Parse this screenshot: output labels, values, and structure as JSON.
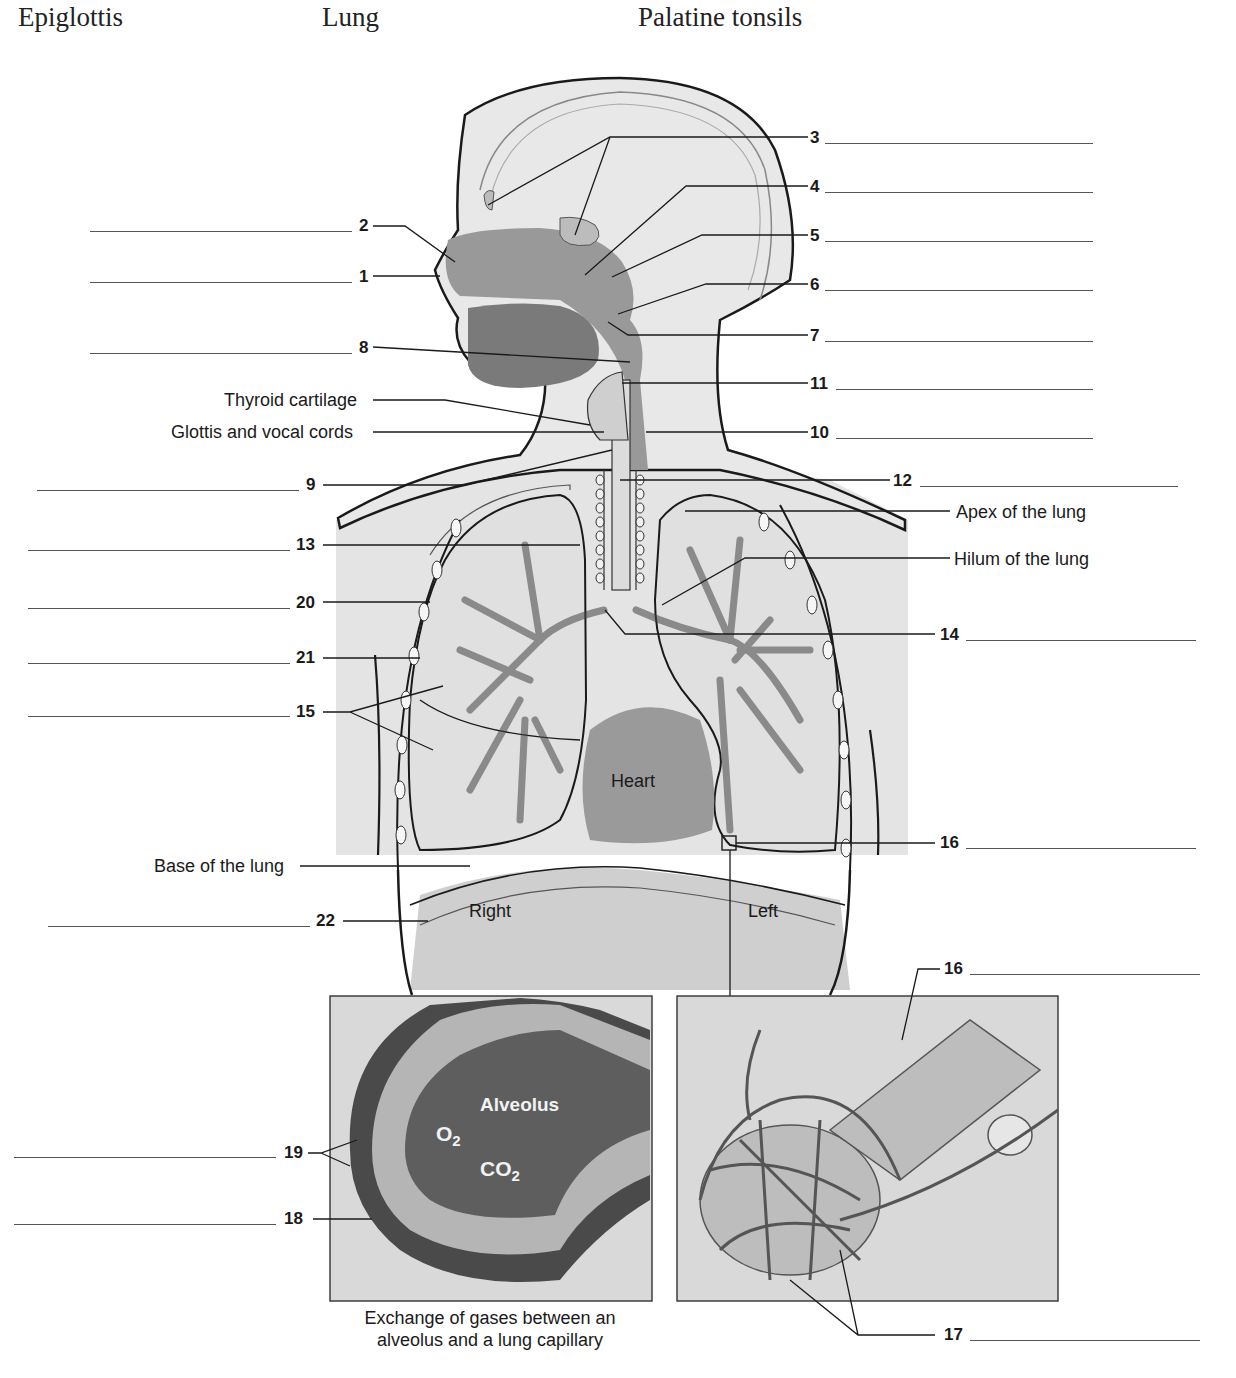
{
  "word_bank": [
    "Epiglottis",
    "Lung",
    "Palatine tonsils"
  ],
  "left_labels": [
    {
      "num": "2"
    },
    {
      "num": "1"
    },
    {
      "num": "8"
    },
    {
      "num": "9"
    },
    {
      "num": "13"
    },
    {
      "num": "20"
    },
    {
      "num": "21"
    },
    {
      "num": "15"
    },
    {
      "num": "22"
    },
    {
      "num": "19"
    },
    {
      "num": "18"
    }
  ],
  "right_labels": [
    {
      "num": "3"
    },
    {
      "num": "4"
    },
    {
      "num": "5"
    },
    {
      "num": "6"
    },
    {
      "num": "7"
    },
    {
      "num": "11"
    },
    {
      "num": "10"
    },
    {
      "num": "12"
    },
    {
      "num": "14"
    },
    {
      "num": "16"
    },
    {
      "num": "16b",
      "text": "16"
    },
    {
      "num": "17"
    }
  ],
  "given_labels": {
    "thyroid_cartilage": "Thyroid cartilage",
    "glottis": "Glottis and vocal cords",
    "apex": "Apex of the lung",
    "hilum": "Hilum of the lung",
    "base": "Base of the lung"
  },
  "figure_labels": {
    "heart": "Heart",
    "right": "Right",
    "left": "Left",
    "alveolus": "Alveolus",
    "o2": "O",
    "o2_sub": "2",
    "co2": "CO",
    "co2_sub": "2"
  },
  "caption": {
    "line1": "Exchange of gases between an",
    "line2": "alveolus and a lung capillary"
  },
  "colors": {
    "body_fill": "#e6e6e6",
    "airway_fill": "#8c8c8c",
    "dark_fill": "#6e6e6e",
    "inset_bg": "#d9d9d9",
    "line": "#1a1a1a"
  }
}
